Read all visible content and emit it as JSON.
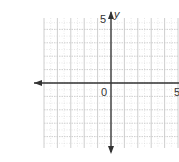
{
  "chart_data": {
    "type": "scatter",
    "title": "",
    "xlabel": "",
    "ylabel": "y",
    "xlim": [
      -5,
      5
    ],
    "ylim": [
      -5,
      5
    ],
    "grid": true,
    "grid_style": "major solid light gray, minor dotted",
    "tick_labels": {
      "origin": "0",
      "x_positive": "5",
      "y_positive": "5"
    },
    "axis_arrows": [
      "left",
      "down",
      "up"
    ],
    "series": []
  },
  "labels": {
    "y_axis": "y",
    "origin": "0",
    "x_five": "5",
    "y_five": "5"
  },
  "colors": {
    "axis": "#333333",
    "grid": "#c8c8c8",
    "grid_minor": "#d8d8d8",
    "background": "#ffffff"
  }
}
